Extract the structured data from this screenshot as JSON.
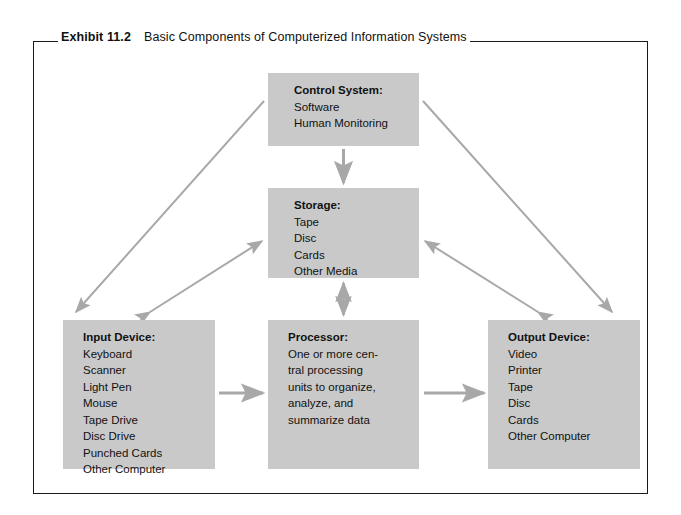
{
  "exhibit": {
    "label": "Exhibit 11.2",
    "caption": "Basic Components of Computerized Information Systems"
  },
  "colors": {
    "box_fill": "#c9c9c9",
    "arrow": "#a8a8a8",
    "frame": "#1a1a1a",
    "text": "#111111",
    "page_background": "#ffffff"
  },
  "nodes": {
    "control": {
      "title": "Control System:",
      "lines": [
        "Software",
        "Human Monitoring"
      ]
    },
    "storage": {
      "title": "Storage:",
      "lines": [
        "Tape",
        "Disc",
        "Cards",
        "Other Media"
      ]
    },
    "input": {
      "title": "Input Device:",
      "lines": [
        "Keyboard",
        "Scanner",
        "Light Pen",
        "Mouse",
        "Tape Drive",
        "Disc Drive",
        "Punched Cards",
        "Other Computer"
      ]
    },
    "processor": {
      "title": "Processor:",
      "lines": [
        "One or more cen-",
        "tral processing",
        "units to organize,",
        "analyze, and",
        "summarize data"
      ]
    },
    "output": {
      "title": "Output Device:",
      "lines": [
        "Video",
        "Printer",
        "Tape",
        "Disc",
        "Cards",
        "Other Computer"
      ]
    }
  },
  "connections": [
    {
      "name": "control-to-storage",
      "from": "control",
      "to": "storage",
      "style": "single",
      "orientation": "vertical"
    },
    {
      "name": "control-to-input",
      "from": "control",
      "to": "input",
      "style": "single",
      "orientation": "diagonal"
    },
    {
      "name": "control-to-output",
      "from": "control",
      "to": "output",
      "style": "single",
      "orientation": "diagonal"
    },
    {
      "name": "storage-input",
      "from": "storage",
      "to": "input",
      "style": "double",
      "orientation": "diagonal"
    },
    {
      "name": "storage-output",
      "from": "storage",
      "to": "output",
      "style": "double",
      "orientation": "diagonal"
    },
    {
      "name": "storage-processor",
      "from": "storage",
      "to": "processor",
      "style": "double",
      "orientation": "vertical"
    },
    {
      "name": "input-to-processor",
      "from": "input",
      "to": "processor",
      "style": "single",
      "orientation": "horizontal"
    },
    {
      "name": "processor-to-output",
      "from": "processor",
      "to": "output",
      "style": "single",
      "orientation": "horizontal"
    }
  ]
}
